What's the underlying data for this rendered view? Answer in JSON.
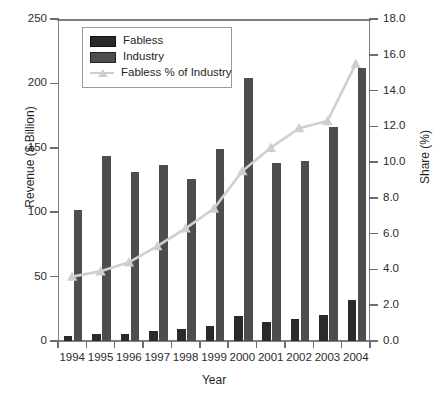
{
  "chart_data": {
    "type": "bar",
    "title": "",
    "xlabel": "Year",
    "ylabel": "Revenue ($ Billion)",
    "y2label": "Share (%)",
    "categories": [
      "1994",
      "1995",
      "1996",
      "1997",
      "1998",
      "1999",
      "2000",
      "2001",
      "2002",
      "2003",
      "2004"
    ],
    "ylim": [
      0,
      250
    ],
    "yticks": [
      "0",
      "50",
      "100",
      "150",
      "200",
      "250"
    ],
    "y2lim": [
      0,
      18
    ],
    "y2ticks": [
      "0.0",
      "2.0",
      "4.0",
      "6.0",
      "8.0",
      "10.0",
      "12.0",
      "14.0",
      "16.0",
      "18.0"
    ],
    "grid": false,
    "legend_position": "upper left",
    "series": [
      {
        "name": "Fabless",
        "kind": "bar",
        "axis": "left",
        "color": "#2a2a2a",
        "values": [
          3.7,
          5.5,
          5.1,
          7.8,
          9.0,
          11.3,
          19.5,
          14.5,
          16.8,
          20.5,
          32.0
        ]
      },
      {
        "name": "Industry",
        "kind": "bar",
        "axis": "left",
        "color": "#4d4d4d",
        "values": [
          101.9,
          144.0,
          131.5,
          137.0,
          125.6,
          149.0,
          204.0,
          138.0,
          140.0,
          166.0,
          212.0
        ]
      },
      {
        "name": "Fabless % of Industry",
        "kind": "line",
        "axis": "right",
        "color": "#cfcfcf",
        "values": [
          3.6,
          3.9,
          4.4,
          5.3,
          6.3,
          7.4,
          9.5,
          10.8,
          11.9,
          12.3,
          15.5
        ]
      }
    ]
  },
  "legend": {
    "items": [
      {
        "label": "Fabless"
      },
      {
        "label": "Industry"
      },
      {
        "label": "Fabless % of Industry"
      }
    ]
  }
}
